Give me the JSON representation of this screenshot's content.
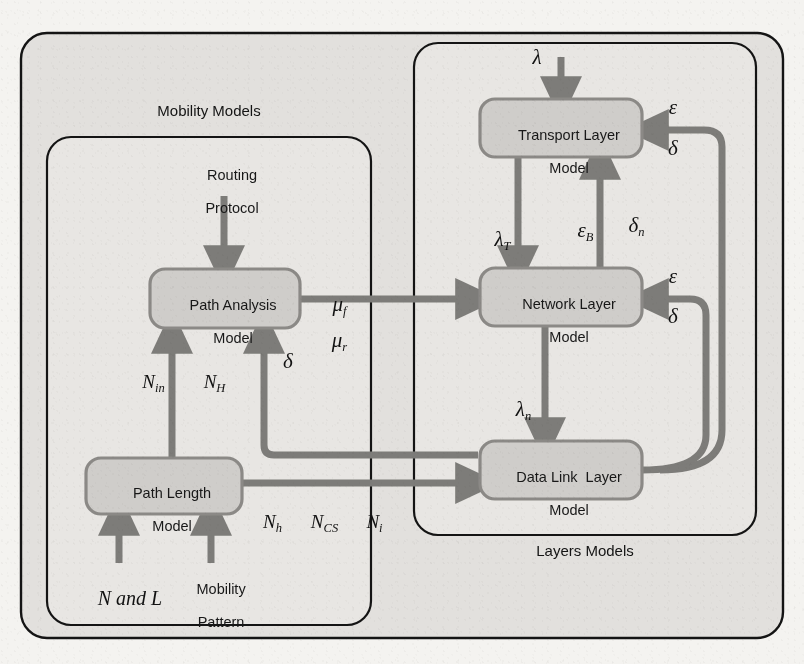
{
  "diagram": {
    "type": "block-diagram",
    "background_color": "#f4f3f0",
    "box_fill_color": "#cfcdca",
    "box_stroke_color": "#7b7a77",
    "arrow_color": "#7d7c79",
    "panel_stroke_color": "#1a1a1a",
    "panels": [
      {
        "id": "outer",
        "label": ""
      },
      {
        "id": "mobility",
        "label": "Mobility Models"
      },
      {
        "id": "layers",
        "label": "Layers Models"
      }
    ],
    "panel_labels": {
      "mobility": "Mobility Models",
      "layers": "Layers Models"
    },
    "boxes": [
      {
        "id": "path-analysis",
        "line1": "Path Analysis",
        "line2": "Model"
      },
      {
        "id": "path-length",
        "line1": "Path Length",
        "line2": "Model"
      },
      {
        "id": "transport-layer",
        "line1": "Transport Layer",
        "line2": "Model"
      },
      {
        "id": "network-layer",
        "line1": "Network Layer",
        "line2": "Model"
      },
      {
        "id": "data-link-layer",
        "line1": "Data Link  Layer",
        "line2": "Model"
      }
    ],
    "external_inputs": [
      {
        "id": "routing-protocol",
        "line1": "Routing",
        "line2": "Protocol"
      },
      {
        "id": "n-and-l",
        "text": "N and L"
      },
      {
        "id": "mobility-pattern",
        "line1": "Mobility",
        "line2": "Pattern"
      }
    ],
    "edge_labels": {
      "lambda": "λ",
      "lambda_T_base": "λ",
      "lambda_T_sub": "T",
      "lambda_n_base": "λ",
      "lambda_n_sub": "n",
      "mu_f_base": "μ",
      "mu_f_sub": "f",
      "mu_r_base": "μ",
      "mu_r_sub": "r",
      "epsilon": "ε",
      "delta": "δ",
      "epsilon_B_base": "ε",
      "epsilon_B_sub": "B",
      "delta_n_base": "δ",
      "delta_n_sub": "n",
      "epsilon_top": "ε",
      "delta_top": "δ",
      "epsilon_mid": "ε",
      "delta_mid": "δ",
      "delta_left": "δ",
      "N_in_base": "N",
      "N_in_sub": "in",
      "N_H_base": "N",
      "N_H_sub": "H",
      "N_h_base": "N",
      "N_h_sub": "h",
      "N_CS_base": "N",
      "N_CS_sub": "CS",
      "N_i_base": "N",
      "N_i_sub": "i",
      "N_and_L_N": "N",
      "N_and_L_and": " and ",
      "N_and_L_L": "L"
    }
  }
}
